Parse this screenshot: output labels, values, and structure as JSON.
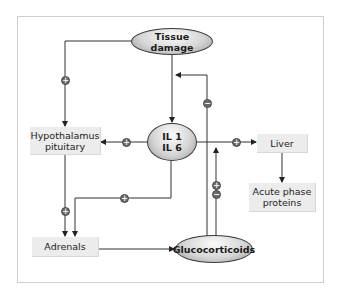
{
  "diagram": {
    "nodes": {
      "tissue_damage": "Tissue damage",
      "il": "IL 1\nIL 6",
      "hypothalamus": "Hypothalamus\npituitary",
      "liver": "Liver",
      "acute_phase": "Acute phase\nproteins",
      "adrenals": "Adrenals",
      "glucocorticoids": "Glucocorticoids"
    },
    "markers": {
      "plus": "+",
      "minus": "−"
    },
    "edges": [
      {
        "from": "Tissue damage",
        "to": "Hypothalamus pituitary",
        "sign": "+"
      },
      {
        "from": "Tissue damage",
        "to": "IL 1 IL 6",
        "sign": ""
      },
      {
        "from": "IL 1 IL 6",
        "to": "Hypothalamus pituitary",
        "sign": "+"
      },
      {
        "from": "IL 1 IL 6",
        "to": "Liver",
        "sign": "+"
      },
      {
        "from": "Liver",
        "to": "Acute phase proteins",
        "sign": ""
      },
      {
        "from": "Hypothalamus pituitary",
        "to": "Adrenals",
        "sign": "+"
      },
      {
        "from": "IL 1 IL 6",
        "to": "Adrenals",
        "sign": "+"
      },
      {
        "from": "Adrenals",
        "to": "Glucocorticoids",
        "sign": ""
      },
      {
        "from": "Glucocorticoids",
        "to": "IL 1 IL 6",
        "sign": "−"
      },
      {
        "from": "Glucocorticoids",
        "to": "IL-Liver pathway",
        "sign": "+/−"
      }
    ],
    "colors": {
      "line": "#333333",
      "box_fill": "#ececec",
      "marker_fill": "#6a6a6a",
      "frame": "#cfcfcf"
    }
  }
}
